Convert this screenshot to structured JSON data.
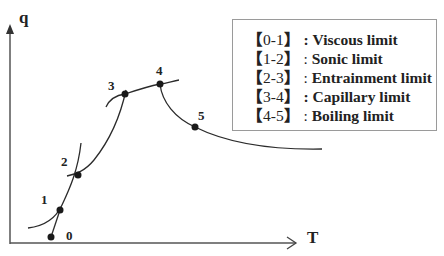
{
  "diagram": {
    "axes": {
      "y_label": "q",
      "x_label": "T"
    },
    "points": [
      {
        "id": "0",
        "label": "0"
      },
      {
        "id": "1",
        "label": "1"
      },
      {
        "id": "2",
        "label": "2"
      },
      {
        "id": "3",
        "label": "3"
      },
      {
        "id": "4",
        "label": "4"
      },
      {
        "id": "5",
        "label": "5"
      }
    ],
    "legend": [
      {
        "open": "【",
        "range": "0-1",
        "close": "】",
        "sep": " : ",
        "name": "Viscous limit"
      },
      {
        "open": "【",
        "range": "1-2",
        "close": "】",
        "sep": " : ",
        "name": "Sonic limit"
      },
      {
        "open": "【",
        "range": "2-3",
        "close": "】",
        "sep": " : ",
        "name": "Entrainment limit"
      },
      {
        "open": "【",
        "range": "3-4",
        "close": "】",
        "sep": " : ",
        "name": "Capillary limit"
      },
      {
        "open": "【",
        "range": "4-5",
        "close": "】",
        "sep": " : ",
        "name": "Boiling limit"
      }
    ],
    "colors": {
      "line": "#2b2b2b",
      "axis": "#555555",
      "legend_border": "#9a9a9a"
    }
  }
}
